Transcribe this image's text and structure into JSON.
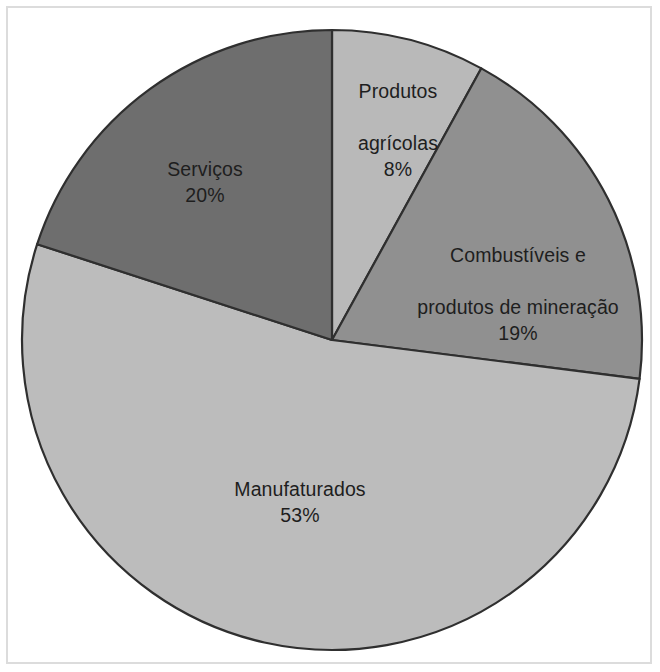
{
  "chart_data": {
    "type": "pie",
    "title": "",
    "subtitle": "",
    "xlabel": "",
    "ylabel": "",
    "legend_position": "none",
    "grid": false,
    "unit": "%",
    "start_angle_deg": 0,
    "direction": "clockwise",
    "categories": [
      "Produtos agrícolas",
      "Combustíveis e produtos de mineração",
      "Manufaturados",
      "Serviços"
    ],
    "values": [
      8,
      19,
      53,
      20
    ],
    "slices": [
      {
        "label": "Produtos\nagrícolas",
        "label_line1": "Produtos",
        "label_line2": "agrícolas",
        "name": "Produtos agrícolas",
        "value": 8,
        "value_text": "8%",
        "color": "#b9b9b9"
      },
      {
        "label": "Combustíveis e\nprodutos de mineração",
        "label_line1": "Combustíveis e",
        "label_line2": "produtos de mineração",
        "name": "Combustíveis e produtos de mineração",
        "value": 19,
        "value_text": "19%",
        "color": "#909090"
      },
      {
        "label": "Manufaturados",
        "label_line1": "Manufaturados",
        "label_line2": "",
        "name": "Manufaturados",
        "value": 53,
        "value_text": "53%",
        "color": "#bcbcbc"
      },
      {
        "label": "Serviços",
        "label_line1": "Serviços",
        "label_line2": "",
        "name": "Serviços",
        "value": 20,
        "value_text": "20%",
        "color": "#6e6e6e"
      }
    ],
    "colors": {
      "slice_outline": "#2f2f2f",
      "label_text": "#1e1e1e",
      "background": "#ffffff",
      "frame_border": "#dcdcdc"
    }
  }
}
